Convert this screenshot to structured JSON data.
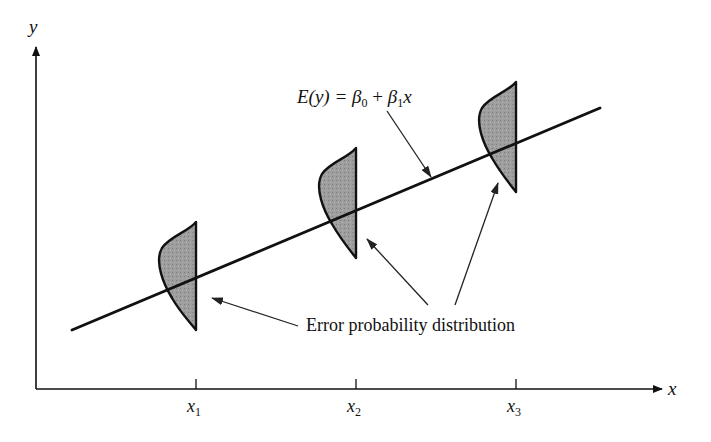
{
  "figure": {
    "type": "simple linear regression error distribution diagram",
    "axes": {
      "x_label": "x",
      "y_label": "y"
    },
    "ticks": [
      {
        "base": "x",
        "sub": "1"
      },
      {
        "base": "x",
        "sub": "2"
      },
      {
        "base": "x",
        "sub": "3"
      }
    ],
    "regression_line": {
      "label_lhs": "E(y) = ",
      "beta0": "β",
      "beta0_sub": "0",
      "plus": " + ",
      "beta1": "β",
      "beta1_sub": "1",
      "x": "x"
    },
    "callout": "Error probability distribution",
    "colors": {
      "ink": "#111111",
      "fill": "#9a9a9a",
      "background": "#ffffff"
    }
  }
}
